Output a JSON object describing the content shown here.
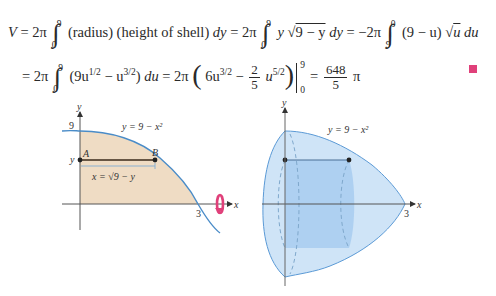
{
  "equation": {
    "line1": {
      "lhs": "V",
      "eq": "=",
      "coef1": "2π",
      "int1_upper": "9",
      "int1_lower": "0",
      "integrand1": "(radius) (height of shell)",
      "d1": "dy",
      "coef2": "2π",
      "int2_upper": "9",
      "int2_lower": "0",
      "integrand2_pre": "y",
      "integrand2_sqrt": "9 − y",
      "coef3": "−2π",
      "int3_upper": "0",
      "int3_lower": "9",
      "integrand3_pre": "(9 − u)",
      "integrand3_sqrt": "u",
      "d3": "du"
    },
    "line2": {
      "coef1": "2π",
      "int_upper": "9",
      "int_lower": "0",
      "integrand_a": "(9u",
      "exp_a": "1/2",
      "minus": "− u",
      "exp_b": "3/2",
      "close": ")",
      "d": "du",
      "coef2": "2π",
      "term1": "6u",
      "exp_c": "3/2",
      "frac_num": "2",
      "frac_den": "5",
      "term2": "u",
      "exp_d": "5/2",
      "eval_upper": "9",
      "eval_lower": "0",
      "result_num": "648",
      "result_den": "5",
      "result_suffix": "π"
    },
    "end_marker_color": "#e0407a"
  },
  "figure_left": {
    "axis_x_label": "x",
    "axis_y_label": "y",
    "curve_label": "y = 9 − x²",
    "tick_y_top": "9",
    "tick_y_point": "y",
    "tick_x": "3",
    "point_a": "A",
    "point_b": "B",
    "segment_label": "x = √9 − y",
    "region_color": "#efdcc4",
    "curve_color": "#4a8cc8",
    "rotation_arrow_color": "#e0407a"
  },
  "figure_right": {
    "axis_x_label": "x",
    "axis_y_label": "y",
    "curve_label": "y = 9 − x²",
    "tick_x": "3",
    "solid_color": "#cfe4f7",
    "shell_color": "#a8cdf0"
  }
}
